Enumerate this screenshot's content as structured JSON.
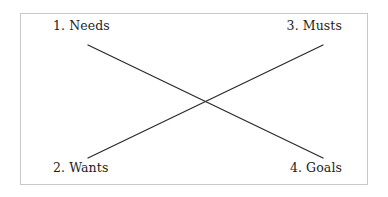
{
  "diagram": {
    "type": "crossing-relationship-diagram",
    "background_color": "#ffffff",
    "frame": {
      "border_color": "#c9c9c9",
      "fill_color": "#ffffff",
      "x": 20,
      "y": 13,
      "width": 348,
      "height": 172
    },
    "labels": {
      "top_left": "1. Needs",
      "top_right": "3. Musts",
      "bottom_left": "2. Wants",
      "bottom_right": "4. Goals"
    },
    "label_color": "#1d1d1d",
    "lines": {
      "stroke_color": "#2b2b2b",
      "stroke_width": 1.3,
      "descending": {
        "name": "needs-to-goals-line",
        "x1": 88,
        "y1": 45,
        "x2": 323,
        "y2": 158
      },
      "ascending": {
        "name": "wants-to-musts-line",
        "x1": 88,
        "y1": 158,
        "x2": 323,
        "y2": 45
      },
      "intersection": {
        "x": 205,
        "y": 102
      }
    }
  }
}
